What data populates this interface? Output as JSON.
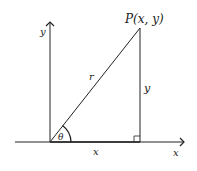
{
  "diagram": {
    "labels": {
      "point": "P(x, y)",
      "y_axis": "y",
      "x_axis": "x",
      "hypotenuse": "r",
      "opposite": "y",
      "adjacent": "x",
      "angle": "θ"
    },
    "colors": {
      "line": "#222222",
      "background": "#ffffff"
    }
  }
}
